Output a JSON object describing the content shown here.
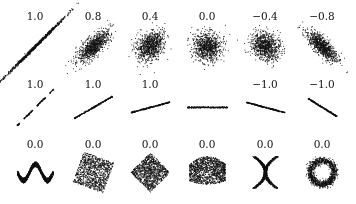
{
  "chart_data": {
    "type": "scatter",
    "title": "",
    "grid": false,
    "point_color": "#111111",
    "background": "#ffffff",
    "rows": [
      {
        "label_y": 10,
        "center_y": 46,
        "panels": [
          {
            "label": "1.0",
            "cx": 35,
            "kind": "gauss",
            "r": 1.0,
            "angle": 45,
            "sx": 22,
            "sy": 0.6
          },
          {
            "label": "0.8",
            "cx": 93,
            "kind": "gauss",
            "r": 0.8,
            "angle": 45,
            "sx": 10,
            "sy": 4
          },
          {
            "label": "0.4",
            "cx": 150,
            "kind": "gauss",
            "r": 0.4,
            "angle": 45,
            "sx": 8,
            "sy": 6
          },
          {
            "label": "0.0",
            "cx": 207,
            "kind": "gauss",
            "r": 0.0,
            "angle": 0,
            "sx": 7,
            "sy": 7
          },
          {
            "label": "−0.4",
            "cx": 265,
            "kind": "gauss",
            "r": -0.4,
            "angle": -45,
            "sx": 8,
            "sy": 6
          },
          {
            "label": "−0.8",
            "cx": 322,
            "kind": "gauss",
            "r": -0.8,
            "angle": -45,
            "sx": 10,
            "sy": 3.5
          }
        ]
      },
      {
        "label_y": 78,
        "center_y": 107,
        "panels": [
          {
            "label": "1.0",
            "cx": 35,
            "kind": "line",
            "angle": 45,
            "len": 52,
            "dashed": true
          },
          {
            "label": "1.0",
            "cx": 93,
            "kind": "line",
            "angle": 30,
            "len": 44
          },
          {
            "label": "1.0",
            "cx": 150,
            "kind": "line",
            "angle": 15,
            "len": 40
          },
          {
            "label": "",
            "cx": 207,
            "kind": "line",
            "angle": 0,
            "len": 40
          },
          {
            "label": "−1.0",
            "cx": 265,
            "kind": "line",
            "angle": -15,
            "len": 40
          },
          {
            "label": "−1.0",
            "cx": 322,
            "kind": "line",
            "angle": -32,
            "len": 34
          }
        ]
      },
      {
        "label_y": 138,
        "center_y": 172,
        "panels": [
          {
            "label": "0.0",
            "cx": 35,
            "kind": "wave"
          },
          {
            "label": "0.0",
            "cx": 93,
            "kind": "square",
            "angle": 20
          },
          {
            "label": "0.0",
            "cx": 150,
            "kind": "square",
            "angle": 45
          },
          {
            "label": "0.0",
            "cx": 207,
            "kind": "parabola"
          },
          {
            "label": "0.0",
            "cx": 265,
            "kind": "cross"
          },
          {
            "label": "0.0",
            "cx": 322,
            "kind": "ring"
          }
        ]
      }
    ]
  }
}
